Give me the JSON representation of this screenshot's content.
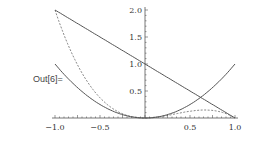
{
  "cell_label": "Out[6]=",
  "colors": {
    "axis": "#555555",
    "curve": "#555555"
  },
  "chart_data": {
    "type": "line",
    "title": "",
    "xlabel": "",
    "ylabel": "",
    "xlim": [
      -1,
      1
    ],
    "ylim": [
      0,
      2
    ],
    "x_ticks": [
      "-1.0",
      "-0.5",
      "0.5",
      "1.0"
    ],
    "y_ticks": [
      "0.5",
      "1.0",
      "1.5",
      "2.0"
    ],
    "grid": false,
    "series": [
      {
        "name": "x^2",
        "style": "solid",
        "x": [
          -1,
          -0.5,
          0,
          0.5,
          1
        ],
        "values": [
          1,
          0.25,
          0,
          0.25,
          1
        ]
      },
      {
        "name": "1-x",
        "style": "solid",
        "x": [
          -1,
          0,
          1
        ],
        "values": [
          2,
          1,
          0
        ]
      },
      {
        "name": "x^2(1-x)",
        "style": "dashed",
        "x": [
          -1,
          -0.5,
          0,
          0.5,
          0.67,
          1
        ],
        "values": [
          2,
          0.375,
          0,
          0.125,
          0.148,
          0
        ]
      }
    ]
  }
}
